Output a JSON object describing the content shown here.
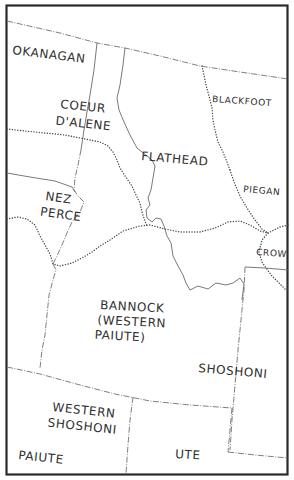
{
  "map": {
    "regions": [
      {
        "id": "okanagan",
        "lines": [
          "OKANAGAN"
        ]
      },
      {
        "id": "coeur-dalene",
        "lines": [
          "COEUR",
          "D'ALENE"
        ]
      },
      {
        "id": "blackfoot",
        "lines": [
          "BLACKFOOT"
        ]
      },
      {
        "id": "flathead",
        "lines": [
          "FLATHEAD"
        ]
      },
      {
        "id": "piegan",
        "lines": [
          "PIEGAN"
        ]
      },
      {
        "id": "nez-perce",
        "lines": [
          "NEZ",
          "PERCE"
        ]
      },
      {
        "id": "crow",
        "lines": [
          "CROW"
        ]
      },
      {
        "id": "bannock",
        "lines": [
          "BANNOCK",
          "(WESTERN",
          "PAIUTE)"
        ]
      },
      {
        "id": "shoshoni",
        "lines": [
          "SHOSHONI"
        ]
      },
      {
        "id": "western-shoshoni",
        "lines": [
          "WESTERN",
          "SHOSHONI"
        ]
      },
      {
        "id": "paiute",
        "lines": [
          "PAIUTE"
        ]
      },
      {
        "id": "ute",
        "lines": [
          "UTE"
        ]
      }
    ],
    "colors": {
      "frame": "#2a2a2a",
      "boundary": "#6a6a6a",
      "text": "#2f2f2f",
      "background": "#ffffff"
    }
  }
}
